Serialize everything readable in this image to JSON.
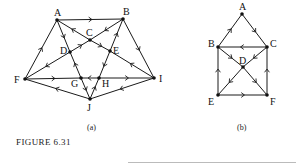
{
  "figure": {
    "caption": "FIGURE 6.31",
    "graphs": [
      {
        "id": "a",
        "sublabel": "(a)",
        "nodes": [
          "A",
          "B",
          "C",
          "D",
          "E",
          "F",
          "G",
          "H",
          "I",
          "J"
        ],
        "edges": [
          {
            "from": "A",
            "to": "B"
          },
          {
            "from": "B",
            "to": "C"
          },
          {
            "from": "C",
            "to": "A"
          },
          {
            "from": "C",
            "to": "E"
          },
          {
            "from": "I",
            "to": "E"
          },
          {
            "from": "A",
            "to": "D"
          },
          {
            "from": "G",
            "to": "D"
          },
          {
            "from": "G",
            "to": "J"
          },
          {
            "from": "D",
            "to": "C"
          },
          {
            "from": "D",
            "to": "F"
          },
          {
            "from": "F",
            "to": "A"
          },
          {
            "from": "E",
            "to": "B"
          },
          {
            "from": "E",
            "to": "H"
          },
          {
            "from": "J",
            "to": "H"
          },
          {
            "from": "F",
            "to": "G"
          },
          {
            "from": "H",
            "to": "G"
          },
          {
            "from": "H",
            "to": "I"
          },
          {
            "from": "B",
            "to": "I"
          },
          {
            "from": "J",
            "to": "F"
          },
          {
            "from": "I",
            "to": "J"
          }
        ]
      },
      {
        "id": "b",
        "sublabel": "(b)",
        "nodes": [
          "A",
          "B",
          "C",
          "D",
          "E",
          "F"
        ],
        "edges": [
          {
            "from": "B",
            "to": "A"
          },
          {
            "from": "A",
            "to": "C"
          },
          {
            "from": "C",
            "to": "B"
          },
          {
            "from": "B",
            "to": "D"
          },
          {
            "from": "C",
            "to": "D"
          },
          {
            "from": "D",
            "to": "E"
          },
          {
            "from": "D",
            "to": "F"
          },
          {
            "from": "E",
            "to": "B"
          },
          {
            "from": "E",
            "to": "F"
          },
          {
            "from": "F",
            "to": "C"
          }
        ]
      }
    ]
  }
}
